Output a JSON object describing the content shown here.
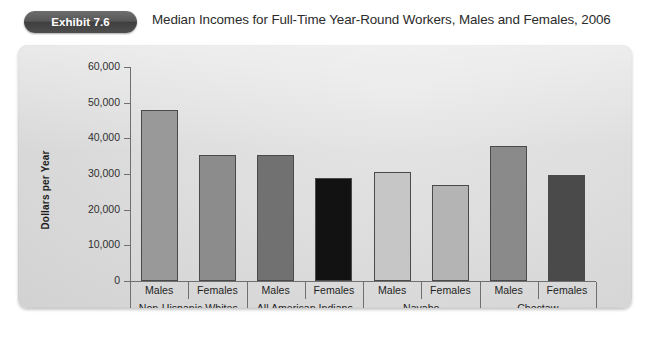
{
  "header": {
    "badge_label": "Exhibit 7.6",
    "title": "Median Incomes for Full-Time Year-Round Workers, Males and Females, 2006"
  },
  "colors": {
    "badge_bg": "#4e4e4e",
    "panel_bg": "#dedede",
    "axis": "#6f6f6f",
    "text": "#1f1f1f"
  },
  "chart_data": {
    "type": "bar",
    "title": "Median Incomes for Full-Time Year-Round Workers, Males and Females, 2006",
    "xlabel": "",
    "ylabel": "Dollars per Year",
    "ylim": [
      0,
      60000
    ],
    "yticks": [
      0,
      10000,
      20000,
      30000,
      40000,
      50000,
      60000
    ],
    "ytick_labels": [
      "0",
      "10,000",
      "20,000",
      "30,000",
      "40,000",
      "50,000",
      "60,000"
    ],
    "grid": false,
    "legend": "none",
    "categories": [
      "Males",
      "Females",
      "Males",
      "Females",
      "Males",
      "Females",
      "Males",
      "Females"
    ],
    "groups": [
      {
        "label": "Non-Hispanic Whites",
        "span": 2
      },
      {
        "label": "All American Indians",
        "span": 2
      },
      {
        "label": "Navaho",
        "span": 2
      },
      {
        "label": "Choctaw",
        "span": 2
      }
    ],
    "values": [
      48000,
      35200,
      35200,
      28800,
      30700,
      26900,
      37800,
      29600
    ],
    "bars": [
      {
        "label": "Males",
        "group": "Non-Hispanic Whites",
        "value": 48000,
        "color": "#999999"
      },
      {
        "label": "Females",
        "group": "Non-Hispanic Whites",
        "value": 35200,
        "color": "#8c8c8c"
      },
      {
        "label": "Males",
        "group": "All American Indians",
        "value": 35200,
        "color": "#717171"
      },
      {
        "label": "Females",
        "group": "All American Indians",
        "value": 28800,
        "color": "#121212"
      },
      {
        "label": "Males",
        "group": "Navaho",
        "value": 30700,
        "color": "#c6c6c6"
      },
      {
        "label": "Females",
        "group": "Navaho",
        "value": 26900,
        "color": "#b4b4b4"
      },
      {
        "label": "Males",
        "group": "Choctaw",
        "value": 37800,
        "color": "#8a8a8a"
      },
      {
        "label": "Females",
        "group": "Choctaw",
        "value": 29600,
        "color": "#4a4a4a"
      }
    ]
  }
}
